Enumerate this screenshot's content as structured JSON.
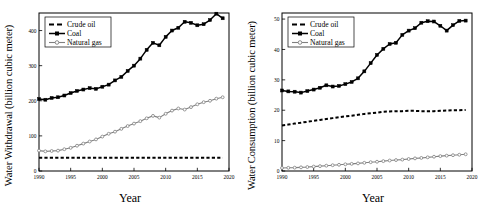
{
  "figure": {
    "panels": [
      "left",
      "right"
    ]
  },
  "chart_data": [
    {
      "panel": "left",
      "type": "line",
      "title": "",
      "xlabel": "Year",
      "ylabel": "Water Withdrawal (billion cubic meter)",
      "xlim": [
        1990,
        2020
      ],
      "ylim": [
        0,
        450
      ],
      "xticks": [
        1990,
        1995,
        2000,
        2005,
        2010,
        2015,
        2020
      ],
      "yticks": [
        0,
        100,
        200,
        300,
        400
      ],
      "grid": false,
      "legend_position": "top-left",
      "x": [
        1990,
        1991,
        1992,
        1993,
        1994,
        1995,
        1996,
        1997,
        1998,
        1999,
        2000,
        2001,
        2002,
        2003,
        2004,
        2005,
        2006,
        2007,
        2008,
        2009,
        2010,
        2011,
        2012,
        2013,
        2014,
        2015,
        2016,
        2017,
        2018,
        2019
      ],
      "series": [
        {
          "name": "Crude oil",
          "style": "dashed",
          "marker": "none",
          "color": "#000000",
          "values": [
            38,
            38,
            38,
            38,
            38,
            38,
            38,
            38,
            38,
            38,
            38,
            38,
            38,
            38,
            38,
            38,
            38,
            38,
            38,
            38,
            38,
            38,
            38,
            38,
            38,
            38,
            38,
            38,
            38,
            38
          ]
        },
        {
          "name": "Coal",
          "style": "solid",
          "marker": "square",
          "color": "#000000",
          "values": [
            205,
            203,
            208,
            210,
            215,
            222,
            228,
            232,
            236,
            234,
            240,
            246,
            258,
            268,
            285,
            300,
            320,
            345,
            365,
            358,
            382,
            400,
            408,
            425,
            422,
            415,
            418,
            430,
            448,
            435
          ]
        },
        {
          "name": "Natural gas",
          "style": "solid",
          "marker": "circle",
          "color": "#808080",
          "values": [
            58,
            56,
            57,
            58,
            62,
            66,
            72,
            78,
            84,
            90,
            98,
            106,
            112,
            120,
            128,
            135,
            142,
            150,
            157,
            152,
            163,
            172,
            178,
            175,
            182,
            190,
            196,
            200,
            206,
            210
          ]
        }
      ]
    },
    {
      "panel": "right",
      "type": "line",
      "title": "",
      "xlabel": "Year",
      "ylabel": "Water Consumption (billion cubic meter)",
      "xlim": [
        1990,
        2020
      ],
      "ylim": [
        0,
        52
      ],
      "xticks": [
        1990,
        1995,
        2000,
        2005,
        2010,
        2015,
        2020
      ],
      "yticks": [
        0,
        10,
        20,
        30,
        40,
        50
      ],
      "grid": false,
      "legend_position": "top-left",
      "x": [
        1990,
        1991,
        1992,
        1993,
        1994,
        1995,
        1996,
        1997,
        1998,
        1999,
        2000,
        2001,
        2002,
        2003,
        2004,
        2005,
        2006,
        2007,
        2008,
        2009,
        2010,
        2011,
        2012,
        2013,
        2014,
        2015,
        2016,
        2017,
        2018,
        2019
      ],
      "series": [
        {
          "name": "Crude oil",
          "style": "dashed",
          "marker": "none",
          "color": "#000000",
          "values": [
            15.0,
            15.3,
            15.6,
            15.9,
            16.2,
            16.5,
            16.8,
            17.1,
            17.4,
            17.7,
            18.0,
            18.2,
            18.5,
            18.8,
            19.0,
            19.2,
            19.5,
            19.6,
            19.7,
            19.7,
            19.8,
            19.8,
            19.7,
            19.7,
            19.7,
            19.8,
            19.9,
            20.0,
            20.0,
            20.1
          ]
        },
        {
          "name": "Coal",
          "style": "solid",
          "marker": "square",
          "color": "#000000",
          "values": [
            26.5,
            26.2,
            26.1,
            25.8,
            26.3,
            26.8,
            27.4,
            28.2,
            27.8,
            28.0,
            28.6,
            29.3,
            30.5,
            32.8,
            35.5,
            38.2,
            40.2,
            41.8,
            42.2,
            44.8,
            46.2,
            47.0,
            48.8,
            49.3,
            49.2,
            47.8,
            46.2,
            48.0,
            49.4,
            49.5
          ]
        },
        {
          "name": "Natural gas",
          "style": "solid",
          "marker": "circle",
          "color": "#808080",
          "values": [
            1.0,
            1.05,
            1.1,
            1.2,
            1.3,
            1.45,
            1.6,
            1.75,
            1.9,
            2.05,
            2.2,
            2.35,
            2.5,
            2.7,
            2.9,
            3.05,
            3.25,
            3.45,
            3.6,
            3.75,
            3.95,
            4.15,
            4.3,
            4.5,
            4.7,
            4.9,
            5.05,
            5.2,
            5.35,
            5.5
          ]
        }
      ]
    }
  ]
}
